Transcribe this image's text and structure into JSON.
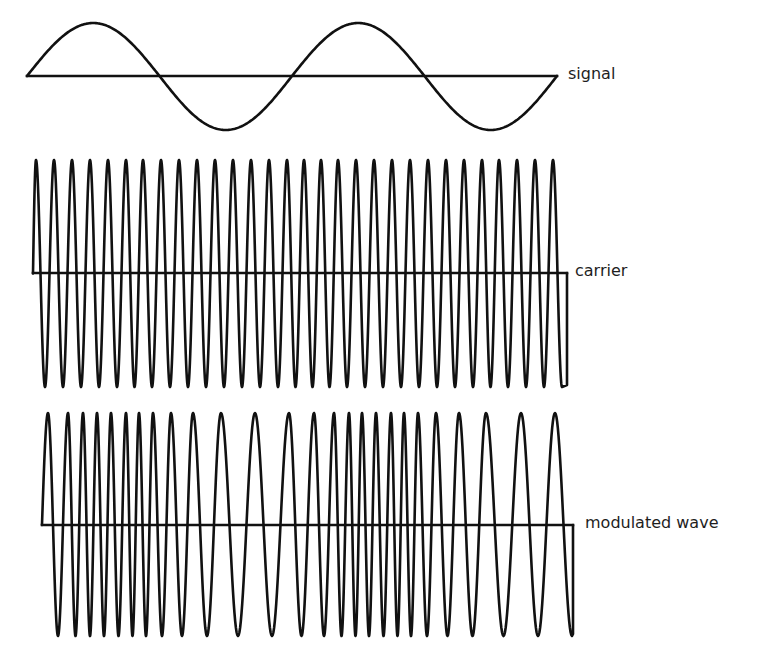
{
  "colors": {
    "stroke": "#111111",
    "text": "#1e1e1e",
    "background": "#ffffff"
  },
  "panels": [
    {
      "id": "signal",
      "label": "signal",
      "baseline_y": 76,
      "x_start": 27,
      "x_end": 557,
      "amplitude_up": 53,
      "amplitude_down": 54,
      "periods": 2,
      "label_x": 568,
      "label_y": 76
    },
    {
      "id": "carrier",
      "label": "carrier",
      "baseline_y": 273,
      "x_start": 33,
      "x_end": 567,
      "top_y": 160,
      "bottom_y": 387,
      "peaks_x": [
        36,
        54,
        72,
        90,
        108,
        126,
        143,
        161,
        179,
        197,
        215,
        233,
        251,
        269,
        287,
        304,
        321,
        338,
        356,
        374,
        392,
        410,
        428,
        446,
        464,
        482,
        499,
        517,
        535,
        553
      ],
      "label_x": 575,
      "label_y": 273
    },
    {
      "id": "modulated",
      "label": "modulated wave",
      "baseline_y": 525,
      "x_start": 42,
      "x_end": 573,
      "top_y": 413,
      "bottom_y": 636,
      "peaks_x": [
        48,
        68,
        83,
        97,
        111,
        126,
        139,
        153,
        171,
        193,
        221,
        255,
        289,
        314,
        334,
        349,
        362,
        376,
        391,
        404,
        418,
        436,
        459,
        486,
        521,
        555
      ],
      "label_x": 585,
      "label_y": 525
    }
  ]
}
